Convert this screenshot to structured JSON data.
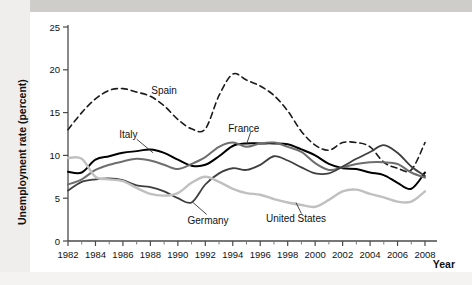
{
  "chart_data": {
    "type": "line",
    "title": "",
    "xlabel": "Year",
    "ylabel": "Unemployment rate (percent)",
    "xlim": [
      1982,
      2008
    ],
    "ylim": [
      0,
      25
    ],
    "yticks": [
      0,
      5,
      10,
      15,
      20,
      25
    ],
    "xticks": [
      1982,
      1984,
      1986,
      1988,
      1990,
      1992,
      1994,
      1996,
      1998,
      2000,
      2002,
      2004,
      2006,
      2008
    ],
    "xtick_labels": [
      "1982",
      "1984",
      "1986",
      "1988",
      "1990",
      "1992",
      "1994",
      "1996",
      "1998",
      "2000",
      "2002",
      "2004",
      "2006",
      "2008"
    ],
    "ytick_labels": [
      "0",
      "5",
      "10",
      "15",
      "20",
      "25"
    ],
    "grid": false,
    "legend": "inline-labels",
    "x": [
      1982,
      1983,
      1984,
      1985,
      1986,
      1987,
      1988,
      1989,
      1990,
      1991,
      1992,
      1993,
      1994,
      1995,
      1996,
      1997,
      1998,
      1999,
      2000,
      2001,
      2002,
      2003,
      2004,
      2005,
      2006,
      2007,
      2008
    ],
    "series": [
      {
        "name": "Spain",
        "style": "dashed",
        "color": "#1a1a1a",
        "width": 1.6,
        "label_pos": {
          "x": 1989.0,
          "y": 17.6
        },
        "values": [
          13.0,
          15.0,
          16.6,
          17.6,
          17.8,
          17.4,
          16.9,
          15.8,
          14.2,
          13.1,
          13.1,
          17.0,
          19.5,
          18.8,
          18.1,
          17.0,
          15.2,
          12.8,
          11.2,
          10.6,
          11.5,
          11.5,
          11.0,
          9.2,
          8.5,
          8.3,
          11.5
        ]
      },
      {
        "name": "Italy",
        "style": "solid",
        "color": "#000000",
        "width": 2.0,
        "label_pos": {
          "x": 1986.4,
          "y": 12.4
        },
        "values": [
          8.1,
          8.0,
          9.5,
          9.9,
          10.3,
          10.5,
          10.7,
          10.3,
          9.5,
          8.8,
          8.9,
          9.9,
          11.1,
          11.4,
          11.4,
          11.4,
          11.3,
          10.7,
          10.0,
          9.0,
          8.5,
          8.4,
          8.0,
          7.7,
          6.8,
          6.1,
          8.0
        ]
      },
      {
        "name": "France",
        "style": "solid",
        "color": "#6e6e6e",
        "width": 2.0,
        "label_pos": {
          "x": 1994.8,
          "y": 13.2
        },
        "values": [
          6.6,
          7.2,
          8.3,
          8.9,
          9.3,
          9.6,
          9.4,
          8.9,
          8.4,
          9.0,
          9.8,
          11.0,
          11.5,
          11.0,
          11.4,
          11.5,
          11.0,
          10.4,
          9.1,
          8.3,
          8.6,
          9.0,
          9.2,
          9.2,
          9.0,
          8.0,
          7.4
        ]
      },
      {
        "name": "Germany",
        "style": "solid",
        "color": "#3f3f3f",
        "width": 1.8,
        "label_pos": {
          "x": 1992.2,
          "y": 2.4
        },
        "values": [
          5.9,
          6.9,
          7.2,
          7.3,
          7.1,
          6.5,
          6.3,
          5.8,
          5.0,
          4.5,
          6.6,
          7.9,
          8.5,
          8.3,
          8.9,
          9.9,
          9.4,
          8.6,
          7.9,
          7.9,
          8.7,
          9.6,
          10.4,
          11.2,
          10.3,
          8.7,
          7.6
        ]
      },
      {
        "name": "United States",
        "style": "solid",
        "color": "#c0c0c0",
        "width": 2.4,
        "label_pos": {
          "x": 1998.6,
          "y": 2.6
        },
        "values": [
          9.7,
          9.6,
          7.5,
          7.2,
          7.0,
          6.2,
          5.5,
          5.3,
          5.6,
          6.8,
          7.5,
          6.9,
          6.1,
          5.6,
          5.4,
          4.9,
          4.5,
          4.2,
          4.0,
          4.8,
          5.8,
          6.0,
          5.5,
          5.1,
          4.6,
          4.6,
          5.8
        ]
      }
    ],
    "annotations": [
      {
        "name": "italy-leader",
        "from": [
          1987.0,
          11.9
        ],
        "to": [
          1988.2,
          10.3
        ]
      },
      {
        "name": "france-leader",
        "from": [
          1995.3,
          12.7
        ],
        "to": [
          1995.0,
          11.3
        ]
      },
      {
        "name": "germany-leader",
        "from": [
          1992.1,
          3.1
        ],
        "to": [
          1991.1,
          4.5
        ]
      },
      {
        "name": "us-leader",
        "from": [
          1999.0,
          3.2
        ],
        "to": [
          1998.6,
          4.5
        ]
      }
    ]
  }
}
